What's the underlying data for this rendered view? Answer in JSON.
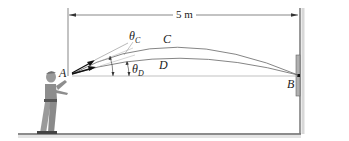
{
  "diagram": {
    "type": "projectile-motion-figure",
    "dimension": {
      "label": "5 m"
    },
    "points": {
      "A": "A",
      "B": "B",
      "C": "C",
      "D": "D"
    },
    "angles": {
      "theta_c": {
        "symbol": "θ",
        "subscript": "C"
      },
      "theta_d": {
        "symbol": "θ",
        "subscript": "D"
      }
    },
    "trajectories": [
      {
        "name": "C",
        "description": "higher arc from A to B"
      },
      {
        "name": "D",
        "description": "lower arc from A to B"
      }
    ],
    "elements": [
      "person throwing",
      "ground",
      "wall",
      "target plate at B"
    ],
    "colors": {
      "line": "#555555",
      "ground": "#777777",
      "wall": "#888888",
      "plate": "#aaaaaa",
      "figure": "#8a8a8a"
    }
  }
}
